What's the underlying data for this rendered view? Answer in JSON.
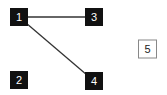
{
  "graph": {
    "nodes": [
      {
        "id": "1",
        "label": "1",
        "style": "filled"
      },
      {
        "id": "2",
        "label": "2",
        "style": "filled"
      },
      {
        "id": "3",
        "label": "3",
        "style": "filled"
      },
      {
        "id": "4",
        "label": "4",
        "style": "filled"
      },
      {
        "id": "5",
        "label": "5",
        "style": "outlined"
      }
    ],
    "edges": [
      {
        "from": "1",
        "to": "3"
      },
      {
        "from": "1",
        "to": "4"
      }
    ],
    "colors": {
      "filled_bg": "#111111",
      "filled_text": "#ffffff",
      "outlined_bg": "#ffffff",
      "outlined_border": "#888888",
      "outlined_text": "#222222",
      "edge": "#333333"
    }
  }
}
